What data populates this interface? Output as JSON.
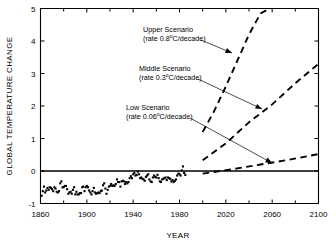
{
  "chart_data": {
    "type": "line",
    "title": "",
    "subtitle": "",
    "xlabel": "YEAR",
    "ylabel": "GLOBAL TEMPERATURE CHANGE",
    "xlim": [
      1860,
      2100
    ],
    "ylim": [
      -1,
      5
    ],
    "xticks": [
      1860,
      1900,
      1940,
      1980,
      2020,
      2060,
      2100
    ],
    "xtick_labels": [
      "1860",
      "1900",
      "1940",
      "1980",
      "2020",
      "2060",
      "2100"
    ],
    "xminor_ticks": [
      1880,
      1920,
      1960,
      2000,
      2040,
      2080
    ],
    "yticks": [
      -1,
      0,
      1,
      2,
      3,
      4,
      5
    ],
    "ytick_labels": [
      "-1",
      "0",
      "1",
      "2",
      "3",
      "4",
      "5"
    ],
    "grid": false,
    "legend_position": "none",
    "zero_reference_line": 0,
    "annotations": [
      {
        "name": "upper-scenario",
        "line1": "Upper Scenario",
        "line2_pre": "(rate 0.8",
        "line2_sup": "o",
        "line2_post": "C/decade)",
        "rate_value": 0.8,
        "rate_units": "°C/decade",
        "text_x": 143,
        "text_y": 32,
        "leader_from": [
          201,
          40
        ],
        "leader_to": [
          232,
          53
        ]
      },
      {
        "name": "middle-scenario",
        "line1": "Middle Scenario",
        "line2_pre": "(rate 0.3",
        "line2_sup": "o",
        "line2_post": "C/decade)",
        "rate_value": 0.3,
        "rate_units": "°C/decade",
        "text_x": 139,
        "text_y": 71,
        "leader_from": [
          198,
          79
        ],
        "leader_to": [
          262,
          109
        ]
      },
      {
        "name": "low-scenario",
        "line1": "Low Scenario",
        "line2_pre": "(rate 0.06",
        "line2_sup": "o",
        "line2_post": "C/decade)",
        "rate_value": 0.06,
        "rate_units": "°C/decade",
        "text_x": 126,
        "text_y": 110,
        "leader_from": [
          190,
          118
        ],
        "leader_to": [
          272,
          163
        ]
      }
    ],
    "series": [
      {
        "name": "Observed global temperature change",
        "style": "scatter",
        "x": [
          1861,
          1862,
          1863,
          1864,
          1865,
          1866,
          1867,
          1868,
          1869,
          1870,
          1871,
          1872,
          1873,
          1874,
          1875,
          1876,
          1877,
          1878,
          1879,
          1880,
          1881,
          1882,
          1883,
          1884,
          1885,
          1886,
          1887,
          1888,
          1889,
          1890,
          1891,
          1892,
          1893,
          1894,
          1895,
          1896,
          1897,
          1898,
          1899,
          1900,
          1901,
          1902,
          1903,
          1904,
          1905,
          1906,
          1907,
          1908,
          1909,
          1910,
          1911,
          1912,
          1913,
          1914,
          1915,
          1916,
          1917,
          1918,
          1919,
          1920,
          1921,
          1922,
          1923,
          1924,
          1925,
          1926,
          1927,
          1928,
          1929,
          1930,
          1931,
          1932,
          1933,
          1934,
          1935,
          1936,
          1937,
          1938,
          1939,
          1940,
          1941,
          1942,
          1943,
          1944,
          1945,
          1946,
          1947,
          1948,
          1949,
          1950,
          1951,
          1952,
          1953,
          1954,
          1955,
          1956,
          1957,
          1958,
          1959,
          1960,
          1961,
          1962,
          1963,
          1964,
          1965,
          1966,
          1967,
          1968,
          1969,
          1970,
          1971,
          1972,
          1973,
          1974,
          1975,
          1976,
          1977,
          1978,
          1979,
          1980,
          1981,
          1982,
          1983,
          1984,
          1985
        ],
        "y": [
          -0.76,
          -0.62,
          -0.48,
          -0.66,
          -0.6,
          -0.52,
          -0.58,
          -0.5,
          -0.52,
          -0.56,
          -0.62,
          -0.5,
          -0.54,
          -0.64,
          -0.66,
          -0.62,
          -0.38,
          -0.32,
          -0.5,
          -0.5,
          -0.46,
          -0.46,
          -0.56,
          -0.7,
          -0.66,
          -0.64,
          -0.7,
          -0.58,
          -0.5,
          -0.72,
          -0.64,
          -0.72,
          -0.72,
          -0.68,
          -0.68,
          -0.5,
          -0.48,
          -0.62,
          -0.5,
          -0.46,
          -0.5,
          -0.6,
          -0.66,
          -0.72,
          -0.62,
          -0.52,
          -0.66,
          -0.7,
          -0.68,
          -0.66,
          -0.68,
          -0.62,
          -0.6,
          -0.44,
          -0.38,
          -0.54,
          -0.7,
          -0.58,
          -0.48,
          -0.46,
          -0.4,
          -0.46,
          -0.44,
          -0.46,
          -0.4,
          -0.26,
          -0.34,
          -0.34,
          -0.48,
          -0.32,
          -0.3,
          -0.32,
          -0.4,
          -0.34,
          -0.38,
          -0.34,
          -0.22,
          -0.16,
          -0.22,
          -0.1,
          -0.06,
          -0.14,
          -0.12,
          -0.02,
          -0.1,
          -0.22,
          -0.2,
          -0.24,
          -0.26,
          -0.3,
          -0.18,
          -0.14,
          -0.1,
          -0.26,
          -0.32,
          -0.34,
          -0.2,
          -0.14,
          -0.18,
          -0.2,
          -0.12,
          -0.22,
          -0.32,
          -0.34,
          -0.26,
          -0.24,
          -0.22,
          -0.2,
          -0.28,
          -0.2,
          -0.22,
          -0.24,
          -0.32,
          -0.28,
          -0.34,
          -0.3,
          -0.26,
          -0.14,
          -0.08,
          -0.1,
          -0.14,
          0.02,
          0.14,
          -0.06,
          -0.12
        ]
      },
      {
        "name": "Upper Scenario",
        "style": "dashed",
        "x": [
          2000,
          2010,
          2020,
          2030,
          2040,
          2050,
          2058
        ],
        "y": [
          1.2,
          1.85,
          2.6,
          3.4,
          4.2,
          4.85,
          5.0
        ]
      },
      {
        "name": "Middle Scenario",
        "style": "dashed",
        "x": [
          2000,
          2020,
          2040,
          2060,
          2080,
          2100
        ],
        "y": [
          0.33,
          0.85,
          1.5,
          2.05,
          2.7,
          3.3
        ]
      },
      {
        "name": "Low Scenario",
        "style": "dashed",
        "x": [
          2000,
          2025,
          2050,
          2075,
          2100
        ],
        "y": [
          -0.08,
          0.05,
          0.2,
          0.35,
          0.52
        ]
      }
    ]
  }
}
